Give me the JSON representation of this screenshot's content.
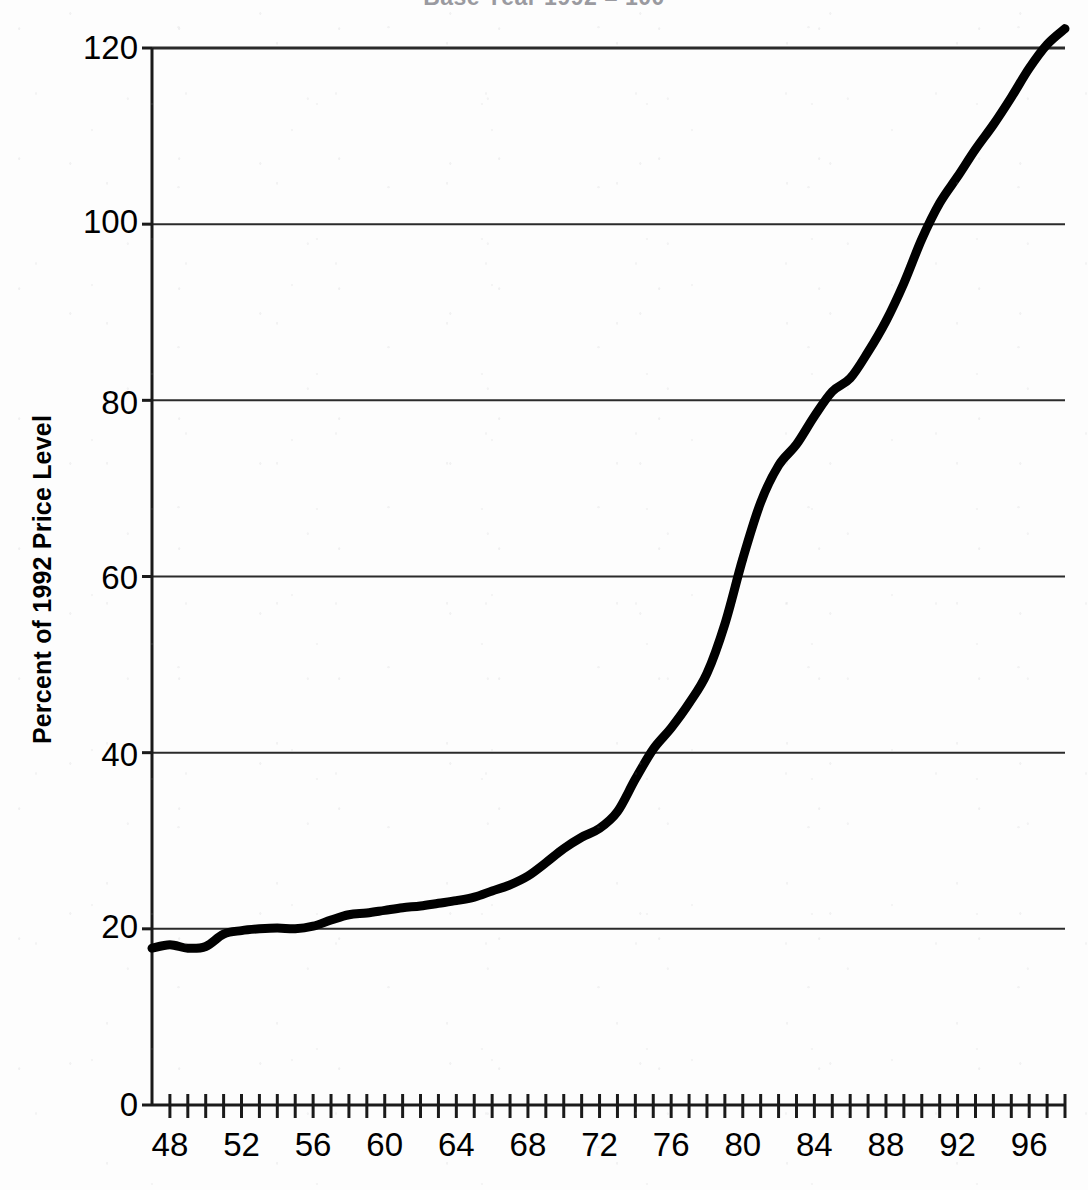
{
  "chart_data": {
    "type": "line",
    "title": "Base Year 1992 = 100",
    "xlabel": "",
    "ylabel": "Percent of 1992 Price Level",
    "xlim": [
      1947,
      1998
    ],
    "ylim": [
      0,
      120
    ],
    "yticks": [
      0,
      20,
      40,
      60,
      80,
      100,
      120
    ],
    "ytick_labels": [
      "0",
      "20",
      "40",
      "60",
      "80",
      "100",
      "120"
    ],
    "xticks": [
      1948,
      1952,
      1956,
      1960,
      1964,
      1968,
      1972,
      1976,
      1980,
      1984,
      1988,
      1992,
      1996
    ],
    "xtick_labels": [
      "48",
      "52",
      "56",
      "60",
      "64",
      "68",
      "72",
      "76",
      "80",
      "84",
      "88",
      "92",
      "96"
    ],
    "xtick_minor_every": 1,
    "grid": "horizontal",
    "legend": "none",
    "line_color": "#000000",
    "line_width_px": 9,
    "series": [
      {
        "name": "Price Level (1992 = 100)",
        "x": [
          1947,
          1948,
          1949,
          1950,
          1951,
          1952,
          1953,
          1954,
          1955,
          1956,
          1957,
          1958,
          1959,
          1960,
          1961,
          1962,
          1963,
          1964,
          1965,
          1966,
          1967,
          1968,
          1969,
          1970,
          1971,
          1972,
          1973,
          1974,
          1975,
          1976,
          1977,
          1978,
          1979,
          1980,
          1981,
          1982,
          1983,
          1984,
          1985,
          1986,
          1987,
          1988,
          1989,
          1990,
          1991,
          1992,
          1993,
          1994,
          1995,
          1996,
          1997,
          1998
        ],
        "values": [
          17.8,
          18.2,
          17.8,
          18.0,
          19.4,
          19.8,
          20.0,
          20.1,
          20.0,
          20.3,
          21.0,
          21.6,
          21.8,
          22.1,
          22.4,
          22.6,
          22.9,
          23.2,
          23.6,
          24.3,
          25.0,
          26.0,
          27.5,
          29.1,
          30.4,
          31.4,
          33.3,
          37.0,
          40.4,
          42.8,
          45.6,
          49.0,
          54.6,
          62.0,
          68.4,
          72.6,
          75.0,
          78.2,
          81.0,
          82.5,
          85.5,
          89.0,
          93.3,
          98.3,
          102.4,
          105.4,
          108.5,
          111.3,
          114.4,
          117.7,
          120.4,
          122.2
        ]
      }
    ]
  },
  "chart": {
    "title": "Base Year 1992 = 100",
    "y_axis_title": "Percent of 1992 Price Level"
  }
}
